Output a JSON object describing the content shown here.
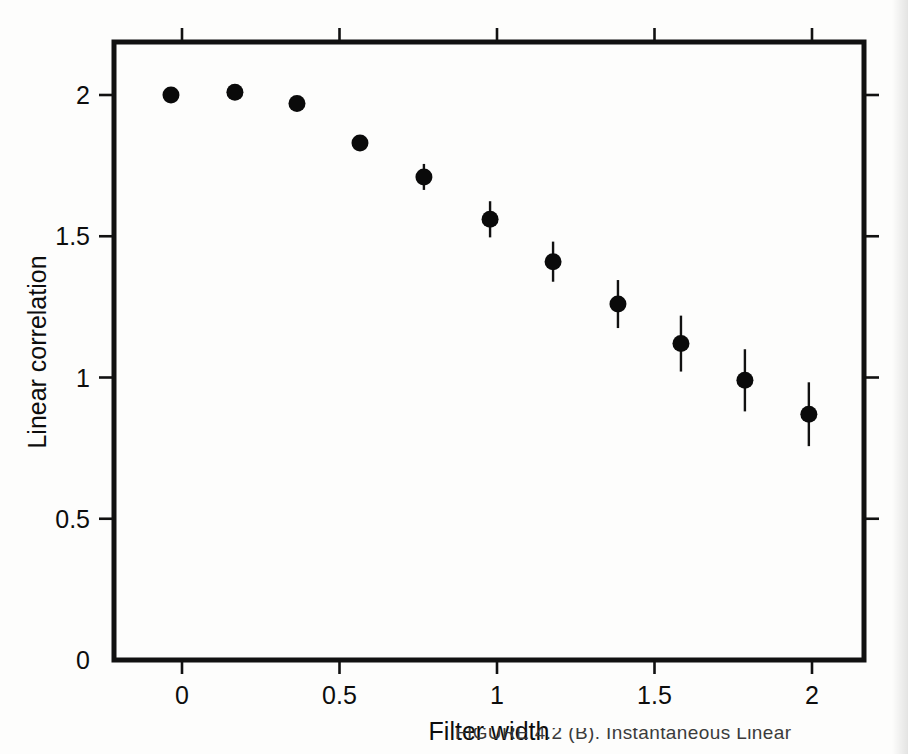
{
  "figure": {
    "name": "linear-correlation-vs-filter-width",
    "marker_color": "#0a0a0a",
    "axis_color": "#111111"
  },
  "caption": {
    "partial_text": "FIGURE 4.2 (B). Instantaneous Linear"
  },
  "chart_data": {
    "type": "scatter",
    "title": "",
    "subtitle": "",
    "xlabel": "Filter width",
    "ylabel": "Linear correlation",
    "xlim": [
      -0.22,
      2.22
    ],
    "ylim": [
      0,
      2.2
    ],
    "xticks": [
      0,
      0.5,
      1,
      1.5,
      2
    ],
    "xtick_labels": [
      "0",
      "0.5",
      "1",
      "1.5",
      "2"
    ],
    "yticks": [
      0,
      0.5,
      1,
      1.5,
      2
    ],
    "ytick_labels": [
      "0",
      "0.5",
      "1",
      "1.5",
      "2"
    ],
    "grid": false,
    "legend": null,
    "legend_position": "none",
    "mirrored_ticks": true,
    "error_bar_type": "symmetric-vertical",
    "x": [
      -0.035,
      0.168,
      0.365,
      0.565,
      0.768,
      0.978,
      1.178,
      1.384,
      1.584,
      1.787,
      1.99
    ],
    "y": [
      2.0,
      2.01,
      1.97,
      1.83,
      1.71,
      1.56,
      1.41,
      1.26,
      1.12,
      0.99,
      0.87
    ],
    "yerr": [
      0.0,
      0.0,
      0.0,
      0.012,
      0.046,
      0.064,
      0.071,
      0.085,
      0.099,
      0.11,
      0.113
    ],
    "series": [
      {
        "name": "Linear correlation",
        "marker": "filled-circle",
        "points": [
          {
            "x": -0.035,
            "y": 2.0,
            "yerr": 0.0
          },
          {
            "x": 0.168,
            "y": 2.01,
            "yerr": 0.0
          },
          {
            "x": 0.365,
            "y": 1.97,
            "yerr": 0.0
          },
          {
            "x": 0.565,
            "y": 1.83,
            "yerr": 0.012
          },
          {
            "x": 0.768,
            "y": 1.71,
            "yerr": 0.046
          },
          {
            "x": 0.978,
            "y": 1.56,
            "yerr": 0.064
          },
          {
            "x": 1.178,
            "y": 1.41,
            "yerr": 0.071
          },
          {
            "x": 1.384,
            "y": 1.26,
            "yerr": 0.085
          },
          {
            "x": 1.584,
            "y": 1.12,
            "yerr": 0.099
          },
          {
            "x": 1.787,
            "y": 0.99,
            "yerr": 0.11
          },
          {
            "x": 1.99,
            "y": 0.87,
            "yerr": 0.113
          }
        ]
      }
    ]
  }
}
